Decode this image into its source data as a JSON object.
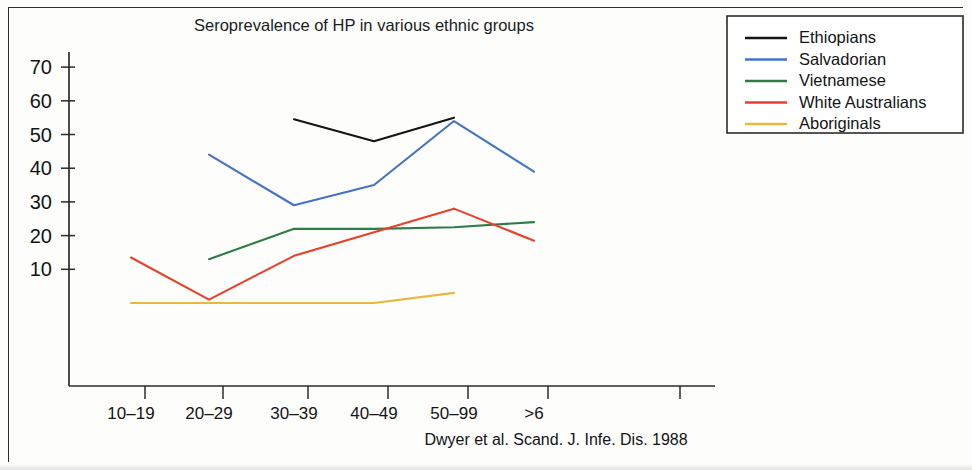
{
  "chart_data": {
    "type": "line",
    "title": "Seroprevalence of HP in various ethnic groups",
    "caption": "Dwyer et al. Scand. J. Infe. Dis. 1988",
    "xlabel": "",
    "ylabel": "",
    "categories": [
      "10–19",
      "20–29",
      "30–39",
      "40–49",
      "50–99",
      ">6"
    ],
    "yticks": [
      10,
      20,
      30,
      40,
      50,
      60,
      70
    ],
    "ylim": [
      0,
      75
    ],
    "grid": false,
    "legend_position": "top-right",
    "series": [
      {
        "name": "Ethiopians",
        "color": "#141414",
        "x": [
          "30–39",
          "40–49",
          "50–99"
        ],
        "values": [
          54.5,
          48,
          55
        ]
      },
      {
        "name": "Salvadorian",
        "color": "#4472c4",
        "x": [
          "20–29",
          "30–39",
          "40–49",
          "50–99",
          ">6"
        ],
        "values": [
          44,
          29,
          35,
          54,
          39
        ]
      },
      {
        "name": "Vietnamese",
        "color": "#2e7d47",
        "x": [
          "20–29",
          "30–39",
          "40–49",
          "50–99",
          ">6"
        ],
        "values": [
          13,
          22,
          22,
          22.5,
          24
        ]
      },
      {
        "name": "White Australians",
        "color": "#e8402a",
        "x": [
          "10–19",
          "20–29",
          "30–39",
          "40–49",
          "50–99",
          ">6"
        ],
        "values": [
          13.5,
          1,
          14,
          21,
          28,
          18.5
        ]
      },
      {
        "name": "Aboriginals",
        "color": "#e9b73a",
        "x": [
          "10–19",
          "20–29",
          "30–39",
          "40–49",
          "50–99"
        ],
        "values": [
          0,
          0,
          0,
          0,
          3
        ]
      }
    ]
  },
  "legend": {
    "items": [
      {
        "label": "Ethiopians",
        "color": "#141414"
      },
      {
        "label": "Salvadorian",
        "color": "#4472c4"
      },
      {
        "label": "Vietnamese",
        "color": "#2e7d47"
      },
      {
        "label": "White Australians",
        "color": "#e8402a"
      },
      {
        "label": "Aboriginals",
        "color": "#e9b73a"
      }
    ]
  },
  "axis": {
    "y_tick_labels": [
      "70",
      "60",
      "50",
      "40",
      "30",
      "20",
      "10"
    ],
    "x_tick_labels": [
      "10–19",
      "20–29",
      "30–39",
      "40–49",
      "50–99",
      ">6"
    ]
  }
}
